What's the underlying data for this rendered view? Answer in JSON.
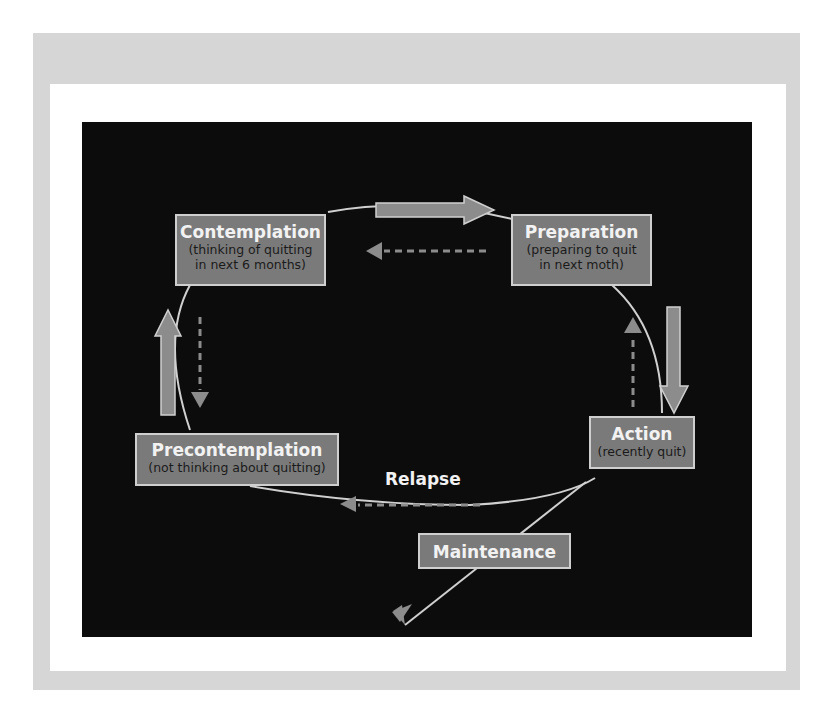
{
  "diagram": {
    "type": "stages-of-change-cycle",
    "colors": {
      "frame": "#d6d6d6",
      "background": "#0c0c0c",
      "box_fill": "#7a7a7a",
      "box_border": "#cfcfcf",
      "arrow": "#8c8c8c",
      "line": "#d0d0d0"
    },
    "stages": {
      "contemplation": {
        "title": "Contemplation",
        "line1": "(thinking of quitting",
        "line2": "in next 6 months)"
      },
      "preparation": {
        "title": "Preparation",
        "line1": "(preparing to quit",
        "line2": "in next moth)"
      },
      "action": {
        "title": "Action",
        "line1": "(recently quit)"
      },
      "precontemplation": {
        "title": "Precontemplation",
        "line1": "(not thinking about quitting)"
      },
      "maintenance": {
        "title": "Maintenance"
      }
    },
    "labels": {
      "relapse": "Relapse"
    },
    "arrows": [
      {
        "from": "contemplation",
        "to": "preparation",
        "style": "solid"
      },
      {
        "from": "preparation",
        "to": "contemplation",
        "style": "dashed"
      },
      {
        "from": "preparation",
        "to": "action",
        "style": "solid"
      },
      {
        "from": "action",
        "to": "preparation",
        "style": "dashed"
      },
      {
        "from": "precontemplation",
        "to": "contemplation",
        "style": "solid"
      },
      {
        "from": "contemplation",
        "to": "precontemplation",
        "style": "dashed"
      },
      {
        "from": "action",
        "to": "precontemplation",
        "style": "dashed",
        "label": "Relapse"
      },
      {
        "from": "action",
        "to": "maintenance",
        "style": "line"
      }
    ]
  }
}
